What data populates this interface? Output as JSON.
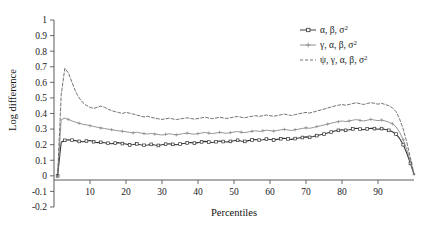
{
  "chart_data": {
    "type": "line",
    "title": "",
    "xlabel": "Percentiles",
    "ylabel": "Log difference",
    "xlim": [
      0,
      100
    ],
    "ylim": [
      -0.2,
      1
    ],
    "grid": false,
    "legend_position": "top-right",
    "xticks": [
      10,
      20,
      30,
      40,
      50,
      60,
      70,
      80,
      90
    ],
    "yticks": [
      "1",
      "0.9",
      "0.8",
      "0.7",
      "0.6",
      "0.5",
      "0.4",
      "0.3",
      "0.2",
      "0.1",
      "0",
      "-0.1",
      "-0.2"
    ],
    "ytick_values": [
      1,
      0.9,
      0.8,
      0.7,
      0.6,
      0.5,
      0.4,
      0.3,
      0.2,
      0.1,
      0,
      -0.1,
      -0.2
    ],
    "x": [
      1,
      2,
      3,
      4,
      5,
      6,
      7,
      8,
      9,
      10,
      11,
      12,
      13,
      14,
      15,
      16,
      17,
      18,
      19,
      20,
      21,
      22,
      23,
      24,
      25,
      26,
      27,
      28,
      29,
      30,
      31,
      32,
      33,
      34,
      35,
      36,
      37,
      38,
      39,
      40,
      41,
      42,
      43,
      44,
      45,
      46,
      47,
      48,
      49,
      50,
      51,
      52,
      53,
      54,
      55,
      56,
      57,
      58,
      59,
      60,
      61,
      62,
      63,
      64,
      65,
      66,
      67,
      68,
      69,
      70,
      71,
      72,
      73,
      74,
      75,
      76,
      77,
      78,
      79,
      80,
      81,
      82,
      83,
      84,
      85,
      86,
      87,
      88,
      89,
      90,
      91,
      92,
      93,
      94,
      95,
      96,
      97,
      98,
      99,
      100
    ],
    "series": [
      {
        "name": "α, β, σ²",
        "legend_label_parts": [
          "α, β, σ",
          "2"
        ],
        "style": "solid-square",
        "color": "#333333",
        "marker": "square",
        "values": [
          0.0,
          0.215,
          0.228,
          0.232,
          0.229,
          0.226,
          0.221,
          0.219,
          0.223,
          0.226,
          0.219,
          0.213,
          0.215,
          0.212,
          0.209,
          0.206,
          0.21,
          0.213,
          0.207,
          0.204,
          0.198,
          0.201,
          0.205,
          0.2,
          0.196,
          0.198,
          0.202,
          0.198,
          0.195,
          0.199,
          0.203,
          0.206,
          0.202,
          0.199,
          0.204,
          0.208,
          0.211,
          0.214,
          0.21,
          0.213,
          0.218,
          0.221,
          0.217,
          0.214,
          0.219,
          0.223,
          0.22,
          0.217,
          0.221,
          0.225,
          0.228,
          0.224,
          0.221,
          0.226,
          0.23,
          0.233,
          0.229,
          0.232,
          0.236,
          0.233,
          0.23,
          0.234,
          0.238,
          0.241,
          0.237,
          0.234,
          0.239,
          0.243,
          0.246,
          0.25,
          0.247,
          0.252,
          0.258,
          0.263,
          0.268,
          0.275,
          0.281,
          0.287,
          0.292,
          0.296,
          0.292,
          0.296,
          0.301,
          0.305,
          0.3,
          0.296,
          0.301,
          0.306,
          0.303,
          0.299,
          0.303,
          0.298,
          0.292,
          0.283,
          0.268,
          0.24,
          0.2,
          0.145,
          0.08,
          0.01
        ]
      },
      {
        "name": "γ, α, β, σ²",
        "legend_label_parts": [
          "γ, α, β, σ",
          "2"
        ],
        "style": "solid-cross",
        "color": "#8a8a8a",
        "marker": "cross",
        "values": [
          0.0,
          0.36,
          0.37,
          0.362,
          0.352,
          0.344,
          0.337,
          0.331,
          0.327,
          0.322,
          0.317,
          0.312,
          0.307,
          0.304,
          0.3,
          0.296,
          0.292,
          0.289,
          0.286,
          0.283,
          0.279,
          0.276,
          0.28,
          0.275,
          0.271,
          0.268,
          0.272,
          0.268,
          0.265,
          0.262,
          0.266,
          0.27,
          0.266,
          0.263,
          0.267,
          0.271,
          0.274,
          0.27,
          0.267,
          0.271,
          0.275,
          0.278,
          0.274,
          0.271,
          0.275,
          0.279,
          0.276,
          0.273,
          0.277,
          0.281,
          0.284,
          0.28,
          0.277,
          0.282,
          0.286,
          0.289,
          0.285,
          0.289,
          0.293,
          0.29,
          0.287,
          0.291,
          0.295,
          0.298,
          0.294,
          0.291,
          0.296,
          0.3,
          0.304,
          0.308,
          0.305,
          0.31,
          0.316,
          0.321,
          0.326,
          0.332,
          0.338,
          0.343,
          0.348,
          0.352,
          0.348,
          0.352,
          0.357,
          0.361,
          0.356,
          0.352,
          0.357,
          0.362,
          0.358,
          0.354,
          0.358,
          0.352,
          0.345,
          0.334,
          0.315,
          0.28,
          0.232,
          0.168,
          0.092,
          0.01
        ]
      },
      {
        "name": "ψ, γ, α, β, σ²",
        "legend_label_parts": [
          "ψ, γ, α, β, σ",
          "2"
        ],
        "style": "dashed",
        "color": "#5a5a5a",
        "marker": "none",
        "values": [
          0.0,
          0.52,
          0.69,
          0.66,
          0.6,
          0.54,
          0.5,
          0.47,
          0.452,
          0.44,
          0.432,
          0.44,
          0.448,
          0.44,
          0.428,
          0.418,
          0.412,
          0.406,
          0.4,
          0.408,
          0.402,
          0.396,
          0.39,
          0.384,
          0.378,
          0.382,
          0.376,
          0.37,
          0.366,
          0.362,
          0.366,
          0.37,
          0.365,
          0.361,
          0.365,
          0.369,
          0.372,
          0.368,
          0.364,
          0.368,
          0.372,
          0.376,
          0.371,
          0.367,
          0.371,
          0.376,
          0.372,
          0.368,
          0.373,
          0.377,
          0.381,
          0.376,
          0.372,
          0.378,
          0.382,
          0.386,
          0.381,
          0.386,
          0.39,
          0.386,
          0.382,
          0.387,
          0.392,
          0.396,
          0.391,
          0.387,
          0.393,
          0.398,
          0.403,
          0.407,
          0.403,
          0.409,
          0.416,
          0.422,
          0.428,
          0.435,
          0.442,
          0.448,
          0.453,
          0.458,
          0.453,
          0.458,
          0.464,
          0.469,
          0.463,
          0.458,
          0.464,
          0.47,
          0.465,
          0.46,
          0.465,
          0.458,
          0.45,
          0.437,
          0.412,
          0.365,
          0.3,
          0.215,
          0.115,
          0.012
        ]
      }
    ]
  }
}
